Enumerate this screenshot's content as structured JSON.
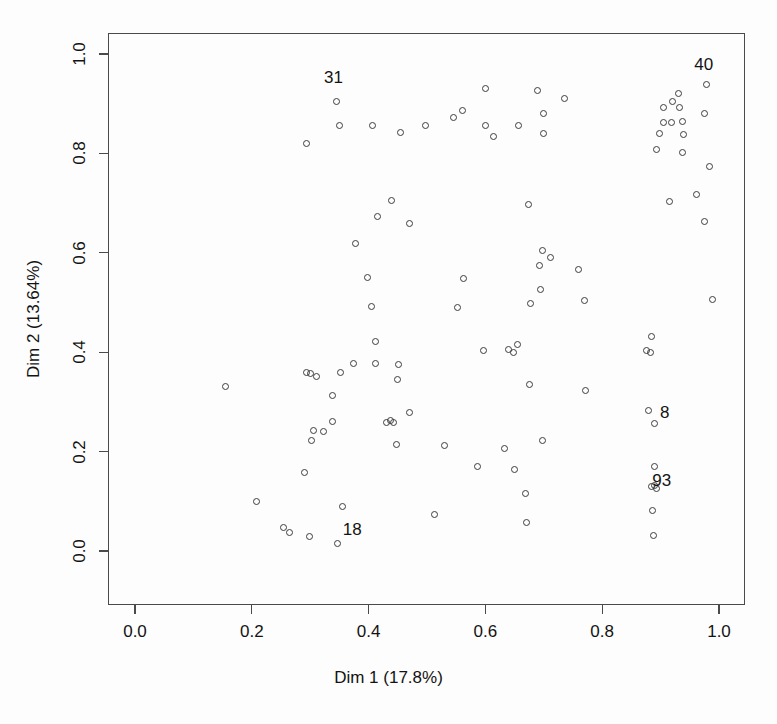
{
  "chart_data": {
    "type": "scatter",
    "title": "",
    "xlabel": "Dim 1 (17.8%)",
    "ylabel": "Dim 2 (13.64%)",
    "xlim": [
      0.0,
      1.0
    ],
    "ylim": [
      0.0,
      1.0
    ],
    "grid": false,
    "legend": null,
    "xticks": [
      "0.0",
      "0.2",
      "0.4",
      "0.6",
      "0.8",
      "1.0"
    ],
    "yticks": [
      "0.0",
      "0.2",
      "0.4",
      "0.6",
      "0.8",
      "1.0"
    ],
    "xtick_values": [
      0.0,
      0.2,
      0.4,
      0.6,
      0.8,
      1.0
    ],
    "ytick_values": [
      0.0,
      0.2,
      0.4,
      0.6,
      0.8,
      1.0
    ],
    "marker": "open-circle",
    "marker_color": "#3d3d3d",
    "points": [
      {
        "x": 0.345,
        "y": 0.905,
        "label": "31"
      },
      {
        "x": 0.293,
        "y": 0.82,
        "label": null
      },
      {
        "x": 0.351,
        "y": 0.857,
        "label": null
      },
      {
        "x": 0.406,
        "y": 0.857,
        "label": null
      },
      {
        "x": 0.455,
        "y": 0.842,
        "label": null
      },
      {
        "x": 0.497,
        "y": 0.857,
        "label": null
      },
      {
        "x": 0.545,
        "y": 0.873,
        "label": null
      },
      {
        "x": 0.561,
        "y": 0.887,
        "label": null
      },
      {
        "x": 0.6,
        "y": 0.93,
        "label": null
      },
      {
        "x": 0.601,
        "y": 0.857,
        "label": null
      },
      {
        "x": 0.614,
        "y": 0.833,
        "label": null
      },
      {
        "x": 0.657,
        "y": 0.857,
        "label": null
      },
      {
        "x": 0.689,
        "y": 0.927,
        "label": null
      },
      {
        "x": 0.7,
        "y": 0.88,
        "label": null
      },
      {
        "x": 0.7,
        "y": 0.84,
        "label": null
      },
      {
        "x": 0.735,
        "y": 0.91,
        "label": null
      },
      {
        "x": 0.905,
        "y": 0.893,
        "label": null
      },
      {
        "x": 0.92,
        "y": 0.905,
        "label": null
      },
      {
        "x": 0.931,
        "y": 0.92,
        "label": null
      },
      {
        "x": 0.933,
        "y": 0.893,
        "label": null
      },
      {
        "x": 0.938,
        "y": 0.865,
        "label": null
      },
      {
        "x": 0.94,
        "y": 0.838,
        "label": null
      },
      {
        "x": 0.978,
        "y": 0.938,
        "label": "40"
      },
      {
        "x": 0.975,
        "y": 0.88,
        "label": null
      },
      {
        "x": 0.893,
        "y": 0.808,
        "label": null
      },
      {
        "x": 0.905,
        "y": 0.862,
        "label": null
      },
      {
        "x": 0.918,
        "y": 0.862,
        "label": null
      },
      {
        "x": 0.898,
        "y": 0.84,
        "label": null
      },
      {
        "x": 0.938,
        "y": 0.802,
        "label": null
      },
      {
        "x": 0.983,
        "y": 0.773,
        "label": null
      },
      {
        "x": 0.962,
        "y": 0.718,
        "label": null
      },
      {
        "x": 0.44,
        "y": 0.705,
        "label": null
      },
      {
        "x": 0.415,
        "y": 0.673,
        "label": null
      },
      {
        "x": 0.47,
        "y": 0.658,
        "label": null
      },
      {
        "x": 0.673,
        "y": 0.698,
        "label": null
      },
      {
        "x": 0.915,
        "y": 0.703,
        "label": null
      },
      {
        "x": 0.975,
        "y": 0.663,
        "label": null
      },
      {
        "x": 0.377,
        "y": 0.619,
        "label": null
      },
      {
        "x": 0.697,
        "y": 0.604,
        "label": null
      },
      {
        "x": 0.692,
        "y": 0.575,
        "label": null
      },
      {
        "x": 0.712,
        "y": 0.59,
        "label": null
      },
      {
        "x": 0.76,
        "y": 0.567,
        "label": null
      },
      {
        "x": 0.398,
        "y": 0.55,
        "label": null
      },
      {
        "x": 0.562,
        "y": 0.548,
        "label": null
      },
      {
        "x": 0.695,
        "y": 0.527,
        "label": null
      },
      {
        "x": 0.405,
        "y": 0.491,
        "label": null
      },
      {
        "x": 0.553,
        "y": 0.489,
        "label": null
      },
      {
        "x": 0.678,
        "y": 0.497,
        "label": null
      },
      {
        "x": 0.77,
        "y": 0.505,
        "label": null
      },
      {
        "x": 0.989,
        "y": 0.507,
        "label": null
      },
      {
        "x": 0.412,
        "y": 0.422,
        "label": null
      },
      {
        "x": 0.596,
        "y": 0.403,
        "label": null
      },
      {
        "x": 0.885,
        "y": 0.432,
        "label": null
      },
      {
        "x": 0.64,
        "y": 0.405,
        "label": null
      },
      {
        "x": 0.648,
        "y": 0.4,
        "label": null
      },
      {
        "x": 0.655,
        "y": 0.415,
        "label": null
      },
      {
        "x": 0.875,
        "y": 0.403,
        "label": null
      },
      {
        "x": 0.883,
        "y": 0.4,
        "label": null
      },
      {
        "x": 0.374,
        "y": 0.377,
        "label": null
      },
      {
        "x": 0.411,
        "y": 0.377,
        "label": null
      },
      {
        "x": 0.452,
        "y": 0.375,
        "label": null
      },
      {
        "x": 0.449,
        "y": 0.345,
        "label": null
      },
      {
        "x": 0.352,
        "y": 0.36,
        "label": null
      },
      {
        "x": 0.294,
        "y": 0.36,
        "label": null
      },
      {
        "x": 0.301,
        "y": 0.357,
        "label": null
      },
      {
        "x": 0.311,
        "y": 0.352,
        "label": null
      },
      {
        "x": 0.155,
        "y": 0.33,
        "label": null
      },
      {
        "x": 0.675,
        "y": 0.335,
        "label": null
      },
      {
        "x": 0.772,
        "y": 0.322,
        "label": null
      },
      {
        "x": 0.339,
        "y": 0.313,
        "label": null
      },
      {
        "x": 0.47,
        "y": 0.278,
        "label": null
      },
      {
        "x": 0.437,
        "y": 0.262,
        "label": null
      },
      {
        "x": 0.443,
        "y": 0.259,
        "label": null
      },
      {
        "x": 0.43,
        "y": 0.258,
        "label": null
      },
      {
        "x": 0.339,
        "y": 0.261,
        "label": null
      },
      {
        "x": 0.306,
        "y": 0.243,
        "label": null
      },
      {
        "x": 0.323,
        "y": 0.24,
        "label": null
      },
      {
        "x": 0.889,
        "y": 0.257,
        "label": "8"
      },
      {
        "x": 0.88,
        "y": 0.282,
        "label": null
      },
      {
        "x": 0.302,
        "y": 0.222,
        "label": null
      },
      {
        "x": 0.448,
        "y": 0.214,
        "label": null
      },
      {
        "x": 0.53,
        "y": 0.213,
        "label": null
      },
      {
        "x": 0.633,
        "y": 0.207,
        "label": null
      },
      {
        "x": 0.697,
        "y": 0.222,
        "label": null
      },
      {
        "x": 0.29,
        "y": 0.157,
        "label": null
      },
      {
        "x": 0.587,
        "y": 0.17,
        "label": null
      },
      {
        "x": 0.65,
        "y": 0.164,
        "label": null
      },
      {
        "x": 0.889,
        "y": 0.17,
        "label": null
      },
      {
        "x": 0.889,
        "y": 0.131,
        "label": "93"
      },
      {
        "x": 0.893,
        "y": 0.126,
        "label": null
      },
      {
        "x": 0.885,
        "y": 0.129,
        "label": null
      },
      {
        "x": 0.669,
        "y": 0.115,
        "label": null
      },
      {
        "x": 0.355,
        "y": 0.09,
        "label": null
      },
      {
        "x": 0.208,
        "y": 0.1,
        "label": null
      },
      {
        "x": 0.67,
        "y": 0.057,
        "label": null
      },
      {
        "x": 0.886,
        "y": 0.082,
        "label": null
      },
      {
        "x": 0.513,
        "y": 0.073,
        "label": null
      },
      {
        "x": 0.255,
        "y": 0.047,
        "label": null
      },
      {
        "x": 0.265,
        "y": 0.038,
        "label": null
      },
      {
        "x": 0.298,
        "y": 0.03,
        "label": null
      },
      {
        "x": 0.347,
        "y": 0.015,
        "label": "18"
      },
      {
        "x": 0.888,
        "y": 0.032,
        "label": null
      }
    ],
    "callout_labels": [
      {
        "text": "31",
        "x": 0.34,
        "y": 0.952
      },
      {
        "text": "40",
        "x": 0.974,
        "y": 0.978
      },
      {
        "text": "8",
        "x": 0.907,
        "y": 0.277
      },
      {
        "text": "93",
        "x": 0.902,
        "y": 0.141
      },
      {
        "text": "18",
        "x": 0.372,
        "y": 0.043
      }
    ]
  }
}
